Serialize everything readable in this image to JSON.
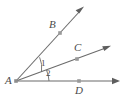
{
  "figure": {
    "type": "geometry-diagram",
    "background_color": "#ffffff",
    "stroke_color": "#6b6b6b",
    "label_color": "#4a4a4a",
    "point_marker_color": "#9a9a9a",
    "width": 124,
    "height": 101,
    "vertex": {
      "name": "vertex-a",
      "label": "A",
      "x": 16,
      "y": 81
    },
    "rays": [
      {
        "name": "ray-ab",
        "label": "",
        "from": [
          16,
          81
        ],
        "to": [
          84,
          7
        ],
        "arrowhead": true,
        "point_on_ray": {
          "label": "B",
          "x": 60,
          "y": 33,
          "label_x": 49,
          "label_y": 20
        }
      },
      {
        "name": "ray-ac",
        "label": "",
        "from": [
          16,
          81
        ],
        "to": [
          111,
          46
        ],
        "arrowhead": true,
        "point_on_ray": {
          "label": "C",
          "x": 77,
          "y": 59,
          "label_x": 74,
          "label_y": 43
        }
      },
      {
        "name": "ray-ad",
        "label": "",
        "from": [
          16,
          81
        ],
        "to": [
          120,
          81
        ],
        "arrowhead": true,
        "point_on_ray": {
          "label": "D",
          "x": 79,
          "y": 81,
          "label_x": 75,
          "label_y": 86
        }
      }
    ],
    "angles": [
      {
        "name": "angle-1",
        "label": "1",
        "between": [
          "ray-ab",
          "ray-ac"
        ],
        "label_x": 41,
        "label_y": 60,
        "arc_radius": 26
      },
      {
        "name": "angle-2",
        "label": "2",
        "between": [
          "ray-ac",
          "ray-ad"
        ],
        "label_x": 46,
        "label_y": 70,
        "arc_radius": 33
      }
    ]
  }
}
